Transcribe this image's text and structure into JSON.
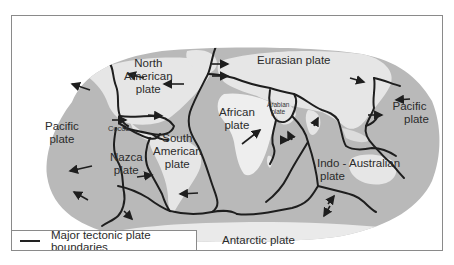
{
  "map": {
    "title": "Major tectonic plates",
    "colors": {
      "ocean": "#b9b9b9",
      "land": "#e6e6e6",
      "boundary": "#1e1e1e",
      "frame": "#8a8a8a"
    },
    "plates": [
      {
        "id": "north-american",
        "lines": [
          "North",
          "American",
          "plate"
        ]
      },
      {
        "id": "eurasian",
        "lines": [
          "Eurasian plate"
        ]
      },
      {
        "id": "pacific-west",
        "lines": [
          "Pacific",
          "plate"
        ]
      },
      {
        "id": "pacific-east",
        "lines": [
          "Pacific",
          "plate"
        ]
      },
      {
        "id": "african",
        "lines": [
          "African",
          "plate"
        ]
      },
      {
        "id": "arabian",
        "lines": [
          "Arabian",
          "plate"
        ]
      },
      {
        "id": "cocos",
        "lines": [
          "Cocos"
        ]
      },
      {
        "id": "nazca",
        "lines": [
          "Nazca",
          "plate"
        ]
      },
      {
        "id": "south-american",
        "lines": [
          "South",
          "American",
          "plate"
        ]
      },
      {
        "id": "indo-australian",
        "lines": [
          "Indo - Australian",
          "plate"
        ]
      },
      {
        "id": "antarctic",
        "lines": [
          "Antarctic plate"
        ]
      }
    ]
  },
  "legend": {
    "items": [
      {
        "symbol": "line",
        "label": "Major tectonic plate boundaries"
      }
    ]
  }
}
